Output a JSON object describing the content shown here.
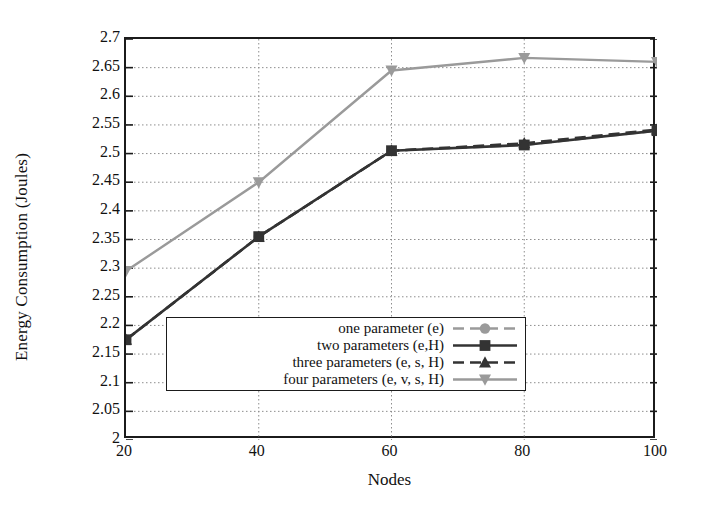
{
  "chart_data": {
    "type": "line",
    "title": "",
    "xlabel": "Nodes",
    "ylabel": "Energy Consumption (Joules)",
    "x": [
      20,
      40,
      60,
      80,
      100
    ],
    "xticks": [
      "20",
      "40",
      "60",
      "80",
      "100"
    ],
    "xlim": [
      20,
      100
    ],
    "yticks": [
      "2",
      "2.05",
      "2.1",
      "2.15",
      "2.2",
      "2.25",
      "2.3",
      "2.35",
      "2.4",
      "2.45",
      "2.5",
      "2.55",
      "2.6",
      "2.65",
      "2.7"
    ],
    "ylim": [
      2,
      2.7
    ],
    "grid": "horizontal-dotted",
    "legend_position": "bottom-right",
    "series": [
      {
        "name": "one parameter (e)",
        "values": [
          2.175,
          2.355,
          2.505,
          2.515,
          2.54
        ],
        "color": "#9a9a9a",
        "marker": "circle",
        "dash": "dashed"
      },
      {
        "name": "two parameters (e,H)",
        "values": [
          2.175,
          2.355,
          2.505,
          2.515,
          2.54
        ],
        "color": "#333333",
        "marker": "square",
        "dash": "solid"
      },
      {
        "name": "three parameters (e, s, H)",
        "values": [
          2.175,
          2.355,
          2.505,
          2.518,
          2.542
        ],
        "color": "#333333",
        "marker": "triangle-up",
        "dash": "dashed"
      },
      {
        "name": "four parameters (e, v, s, H)",
        "values": [
          2.295,
          2.45,
          2.645,
          2.667,
          2.66
        ],
        "color": "#9a9a9a",
        "marker": "triangle-down",
        "dash": "solid"
      }
    ]
  },
  "legend": {
    "entries": [
      "one parameter (e)",
      "two parameters (e,H)",
      "three parameters (e, s, H)",
      "four parameters (e, v, s, H)"
    ]
  },
  "colors": {
    "dark_series": "#333333",
    "light_series": "#9a9a9a",
    "axis": "#1b1b1b",
    "grid": "#8d8d8d",
    "background": "#ffffff"
  }
}
